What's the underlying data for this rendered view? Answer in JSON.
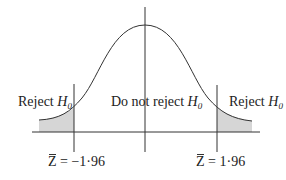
{
  "diagram": {
    "curve": "standard normal distribution",
    "colors": {
      "line": "#333333",
      "shade": "#d6d6d6",
      "background": "#ffffff"
    },
    "regions": [
      {
        "id": "left",
        "label_text": "Reject ",
        "label_var": "H",
        "label_sub": "0",
        "shaded": true
      },
      {
        "id": "center",
        "label_text": "Do not reject ",
        "label_var": "H",
        "label_sub": "0",
        "shaded": false
      },
      {
        "id": "right",
        "label_text": "Reject ",
        "label_var": "H",
        "label_sub": "0",
        "shaded": true
      }
    ],
    "critical_values": [
      {
        "id": "lower",
        "symbol": "Z",
        "relation": " = ",
        "value": "−1·96"
      },
      {
        "id": "upper",
        "symbol": "Z",
        "relation": " = ",
        "value": "1·96"
      }
    ]
  }
}
